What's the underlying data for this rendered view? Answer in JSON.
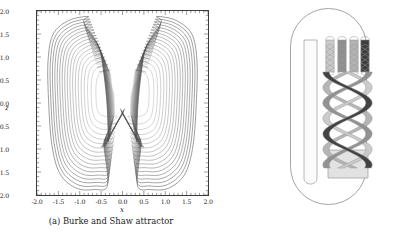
{
  "figure": {
    "panel_a": {
      "caption": "(a) Burke and Shaw attractor",
      "xlabel": "x",
      "ylabel": "z"
    },
    "panel_b": {
      "caption": "(b) Four branches template"
    }
  },
  "colors": {
    "axis": "#3a3a3a",
    "trajectory": "#4d4d4d",
    "outline": "#9a9a9a",
    "branch_dark": "#3d3d3d",
    "branch_mid": "#8e8e8e",
    "branch_light": "#c9c9c9",
    "branch_plate": "#e2e2e2",
    "background": "#ffffff"
  },
  "chart_data": [
    {
      "id": "burke-and-shaw-attractor",
      "type": "line",
      "title": "(a) Burke and Shaw attractor",
      "subtitle": "",
      "xlabel": "x",
      "ylabel": "z",
      "xlim": [
        -2.0,
        2.0
      ],
      "ylim": [
        -2.0,
        2.0
      ],
      "grid": false,
      "legend": null,
      "xticks": [
        "-2.0",
        "-1.5",
        "-1.0",
        "-0.5",
        "0.0",
        "0.5",
        "1.0",
        "1.5",
        "2.0"
      ],
      "xtick_values": [
        -2.0,
        -1.5,
        -1.0,
        -0.5,
        0.0,
        0.5,
        1.0,
        1.5,
        2.0
      ],
      "yticks": [
        "-2.0",
        "-1.5",
        "-1.0",
        "-0.5",
        "0.0",
        "0.5",
        "1.0",
        "1.5",
        "2.0"
      ],
      "ytick_values": [
        -2.0,
        -1.5,
        -1.0,
        -0.5,
        0.0,
        0.5,
        1.0,
        1.5,
        2.0
      ],
      "minor_ticks_per_major": 5,
      "tick_direction": "in",
      "series": [
        {
          "name": "trajectory",
          "description": "Chaotic phase-portrait projection of the Burke and Shaw system onto the (x,z) plane: two symmetric lobes joined by a braided crossing region near x=0.",
          "color": "#4d4d4d",
          "linewidth": 0.4,
          "n_revolutions": 18,
          "lobe_centers": [
            [
              -0.85,
              0.35
            ],
            [
              0.85,
              0.35
            ]
          ],
          "lobe_extent_x": [
            -1.72,
            1.72
          ],
          "lobe_extent_z": [
            -1.9,
            1.88
          ],
          "crossing_region_x": [
            -0.45,
            0.45
          ],
          "crossing_region_z": [
            -0.95,
            -0.1
          ]
        }
      ]
    },
    {
      "id": "four-branches-template",
      "type": "diagram",
      "title": "(b) Four branches template",
      "branch_count": 4,
      "branch_shades": [
        "#c9c9c9",
        "#8e8e8e",
        "#b3b3b3",
        "#3d3d3d"
      ],
      "outline_shape": "stadium-capsule",
      "description": "Branched manifold (knot holder) with four branches that twist into a braid and merge on a squeezing plate."
    }
  ]
}
